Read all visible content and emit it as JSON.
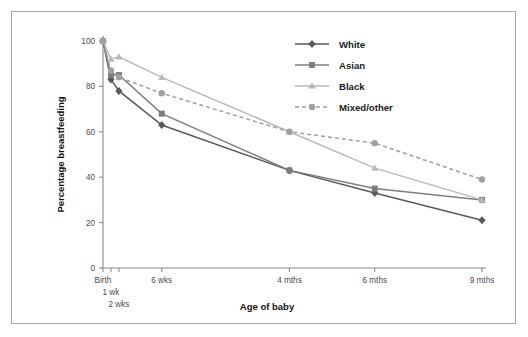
{
  "chart_data": {
    "type": "line",
    "title": "",
    "xlabel": "Age of baby",
    "ylabel": "Percentage breastfeeding",
    "categories": [
      "Birth",
      "1 wk",
      "2 wks",
      "6 wks",
      "4 mths",
      "6 mths",
      "9 mths"
    ],
    "x_tick_labels": [
      "Birth",
      "1 wk",
      "2 wks",
      "6 wks",
      "4 mths",
      "6 mths",
      "9 mths"
    ],
    "y_tick_labels": [
      "0",
      "20",
      "40",
      "60",
      "80",
      "100"
    ],
    "y_ticks": [
      0,
      20,
      40,
      60,
      80,
      100
    ],
    "ylim": [
      0,
      100
    ],
    "grid": false,
    "legend_position": "top-right",
    "series": [
      {
        "name": "White",
        "color": "#595959",
        "marker": "diamond",
        "line_style": "solid",
        "values": [
          100,
          83,
          78,
          63,
          43,
          33,
          21
        ]
      },
      {
        "name": "Asian",
        "color": "#7d7d7d",
        "marker": "square",
        "line_style": "solid",
        "values": [
          100,
          85,
          85,
          68,
          43,
          35,
          30
        ]
      },
      {
        "name": "Black",
        "color": "#b9b9b9",
        "marker": "triangle",
        "line_style": "solid",
        "values": [
          100,
          92,
          93,
          84,
          60,
          44,
          30
        ]
      },
      {
        "name": "Mixed/other",
        "color": "#a0a0a0",
        "marker": "circle",
        "line_style": "dashed",
        "values": [
          100,
          87,
          84,
          77,
          60,
          55,
          39
        ]
      }
    ]
  },
  "legend": {
    "items": [
      {
        "label": "White"
      },
      {
        "label": "Asian"
      },
      {
        "label": "Black"
      },
      {
        "label": "Mixed/other"
      }
    ]
  },
  "axes": {
    "x_title": "Age of baby",
    "y_title": "Percentage breastfeeding"
  },
  "colors": {
    "frame_border": "#a8a8a8",
    "axis_line": "#8a8a8a",
    "background": "#ffffff",
    "text": "#1a1a1a",
    "tick_text": "#4a4a4a"
  }
}
